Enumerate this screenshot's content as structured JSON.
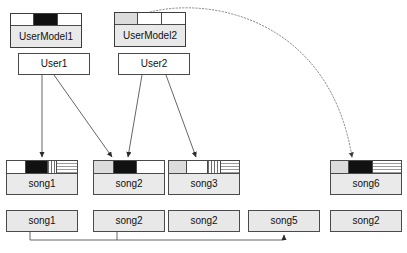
{
  "diagram": {
    "colors": {
      "stroke": "#4a4a4a",
      "fill_gray": "#e8e8e8",
      "fill_dark": "#111111",
      "background": "#ffffff"
    },
    "user_models": [
      {
        "label": "UserModel1",
        "x": 10,
        "y": 13,
        "width": 72,
        "height": 35,
        "header_height": 12,
        "cells": [
          "white",
          "black",
          "white"
        ]
      },
      {
        "label": "UserModel2",
        "x": 114,
        "y": 12,
        "width": 72,
        "height": 35,
        "header_height": 12,
        "cells": [
          "gray",
          "white",
          "white"
        ]
      }
    ],
    "users": [
      {
        "label": "User1",
        "x": 18,
        "y": 53,
        "width": 72,
        "height": 22
      },
      {
        "label": "User2",
        "x": 118,
        "y": 53,
        "width": 72,
        "height": 22
      }
    ],
    "song_models": [
      {
        "label": "song1",
        "x": 6,
        "y": 160,
        "width": 72,
        "height": 35,
        "header_height": 13,
        "cells": [
          "dots",
          "black",
          "vhatch",
          "hhatch"
        ]
      },
      {
        "label": "song2",
        "x": 93,
        "y": 160,
        "width": 72,
        "height": 35,
        "header_height": 13,
        "cells": [
          "gray",
          "black",
          "white"
        ]
      },
      {
        "label": "song3",
        "x": 168,
        "y": 160,
        "width": 72,
        "height": 35,
        "header_height": 13,
        "cells": [
          "gray",
          "white",
          "vhatch",
          "hhatch"
        ]
      },
      {
        "label": "song6",
        "x": 330,
        "y": 160,
        "width": 72,
        "height": 35,
        "header_height": 13,
        "cells": [
          "gray",
          "black",
          "hhatch"
        ]
      }
    ],
    "songs": [
      {
        "label": "song1",
        "x": 6,
        "y": 210,
        "width": 72,
        "height": 22
      },
      {
        "label": "song2",
        "x": 93,
        "y": 210,
        "width": 72,
        "height": 22
      },
      {
        "label": "song2",
        "x": 168,
        "y": 210,
        "width": 72,
        "height": 22
      },
      {
        "label": "song5",
        "x": 248,
        "y": 210,
        "width": 72,
        "height": 22
      },
      {
        "label": "song2",
        "x": 330,
        "y": 210,
        "width": 72,
        "height": 22
      }
    ],
    "edges": [
      {
        "name": "user1-to-song1",
        "from": "User1",
        "to": "song1",
        "style": "solid",
        "arrow": true
      },
      {
        "name": "user1-to-song2",
        "from": "User1",
        "to": "song2",
        "style": "solid",
        "arrow": true
      },
      {
        "name": "user2-to-song2",
        "from": "User2",
        "to": "song2",
        "style": "solid",
        "arrow": true
      },
      {
        "name": "user2-to-song3",
        "from": "User2",
        "to": "song3",
        "style": "solid",
        "arrow": true
      },
      {
        "name": "usermodel2-to-song6",
        "from": "UserModel2",
        "to": "song6",
        "style": "dotted",
        "arrow": true
      },
      {
        "name": "song1-song2-to-song5",
        "from": "song1,song2",
        "to": "song5",
        "style": "solid",
        "arrow": true
      }
    ]
  }
}
